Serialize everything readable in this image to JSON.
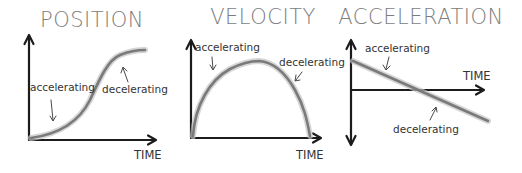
{
  "panels": [
    {
      "title": "POSITION",
      "x_axis_label": "TIME",
      "annotations": [
        "accelerating",
        "decelerating"
      ]
    },
    {
      "title": "VELOCITY",
      "x_axis_label": "TIME",
      "annotations": [
        "accelerating",
        "decelerating"
      ]
    },
    {
      "title": "ACCELERATION",
      "x_axis_label": "TIME",
      "annotations": [
        "accelerating",
        "decelerating"
      ]
    }
  ],
  "colors": {
    "axis": "#1c1c1c",
    "curve": "#7a7a7a",
    "title": "#7d7d7d",
    "text": "#333333",
    "background": "#ffffff"
  }
}
